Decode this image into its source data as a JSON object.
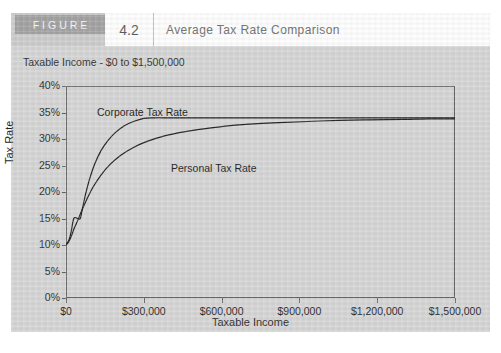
{
  "figure": {
    "word": "FIGURE",
    "number": "4.2",
    "title": "Average Tax Rate Comparison"
  },
  "chart_data": {
    "type": "line",
    "title": "Average Tax Rate Comparison",
    "subtitle": "Taxable Income - $0 to $1,500,000",
    "xlabel": "Taxable Income",
    "ylabel": "Tax Rate",
    "xlim": [
      0,
      1500000
    ],
    "ylim": [
      0,
      40
    ],
    "grid": false,
    "legend_position": "inline-annotation",
    "x_tick_labels": [
      "$0",
      "$300,000",
      "$600,000",
      "$900,000",
      "$1,200,000",
      "$1,500,000"
    ],
    "x_tick_values": [
      0,
      300000,
      600000,
      900000,
      1200000,
      1500000
    ],
    "y_tick_labels": [
      "0%",
      "5%",
      "10%",
      "15%",
      "20%",
      "25%",
      "30%",
      "35%",
      "40%"
    ],
    "y_tick_values": [
      0,
      5,
      10,
      15,
      20,
      25,
      30,
      35,
      40
    ],
    "series": [
      {
        "name": "Corporate Tax Rate",
        "color": "#1a1a1a",
        "x": [
          0,
          12000,
          20000,
          30000,
          45000,
          55000,
          62000,
          75000,
          90000,
          110000,
          135000,
          160000,
          190000,
          225000,
          260000,
          300000,
          340000,
          400000,
          500000,
          650000,
          800000,
          1000000,
          1200000,
          1350000,
          1500000
        ],
        "y": [
          10.0,
          11.0,
          12.5,
          15.0,
          15.0,
          15.0,
          16.5,
          19.5,
          22.3,
          25.2,
          27.8,
          29.6,
          31.2,
          32.5,
          33.3,
          33.9,
          34.0,
          34.0,
          34.0,
          34.0,
          34.0,
          34.0,
          34.0,
          34.0,
          34.0
        ]
      },
      {
        "name": "Personal Tax Rate",
        "color": "#1a1a1a",
        "x": [
          0,
          10000,
          20000,
          32000,
          45000,
          60000,
          80000,
          105000,
          135000,
          170000,
          210000,
          260000,
          310000,
          380000,
          460000,
          560000,
          680000,
          820000,
          980000,
          1150000,
          1300000,
          1400000,
          1500000
        ],
        "y": [
          10.0,
          10.6,
          11.6,
          13.2,
          14.6,
          16.4,
          18.6,
          21.0,
          23.2,
          25.2,
          26.9,
          28.4,
          29.5,
          30.6,
          31.4,
          32.1,
          32.7,
          33.1,
          33.4,
          33.6,
          33.7,
          33.8,
          33.8
        ]
      }
    ],
    "annotations": [
      {
        "text": "Corporate Tax Rate",
        "x": 170000,
        "y": 37.5
      },
      {
        "text": "Personal Tax Rate",
        "x": 480000,
        "y": 27.0
      }
    ]
  }
}
